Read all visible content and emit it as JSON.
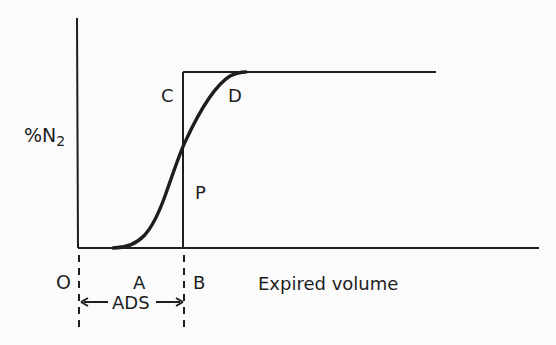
{
  "diagram": {
    "title": "",
    "y_axis_label": "%N",
    "y_axis_label_subscript": "2",
    "x_axis_label": "Expired volume",
    "points": {
      "origin": "O",
      "A": "A",
      "B": "B",
      "C": "C",
      "D": "D",
      "P": "P"
    },
    "dimension_label": "ADS",
    "arrow_left": "←",
    "arrow_right": "→"
  }
}
